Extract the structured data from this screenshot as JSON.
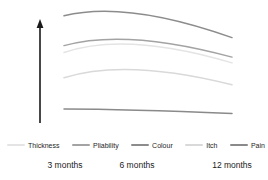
{
  "y_axis": {
    "label_line1": "Increasing severity of burn scar",
    "label_line2": "characteristic"
  },
  "x_axis": {
    "labels": [
      "3 months",
      "6 months",
      "12 months"
    ]
  },
  "legend": {
    "items": [
      {
        "label": "Thickness",
        "color": "#e4e4e4"
      },
      {
        "label": "Pliability",
        "color": "#a3a3a3"
      },
      {
        "label": "Colour",
        "color": "#8c8c8c"
      },
      {
        "label": "Itch",
        "color": "#d9d9d9"
      },
      {
        "label": "Pain",
        "color": "#8a8a8a"
      }
    ]
  },
  "chart_data": {
    "type": "line",
    "title": "",
    "xlabel": "",
    "ylabel": "Increasing severity of burn scar characteristic",
    "categories": [
      "3 months",
      "6 months",
      "12 months"
    ],
    "series": [
      {
        "name": "Thickness",
        "color": "#e4e4e4",
        "values": [
          6.3,
          7.0,
          5.4
        ]
      },
      {
        "name": "Pliability",
        "color": "#a3a3a3",
        "values": [
          6.9,
          7.4,
          5.9
        ]
      },
      {
        "name": "Colour",
        "color": "#8c8c8c",
        "values": [
          9.5,
          9.7,
          7.6
        ]
      },
      {
        "name": "Itch",
        "color": "#d9d9d9",
        "values": [
          4.1,
          4.8,
          3.5
        ]
      },
      {
        "name": "Pain",
        "color": "#8a8a8a",
        "values": [
          1.4,
          1.3,
          1.0
        ]
      }
    ],
    "ylim": [
      0,
      10
    ],
    "y_axis_style": "unscaled arrow (relative severity, no tick values)",
    "grid": false,
    "legend_position": "bottom"
  }
}
